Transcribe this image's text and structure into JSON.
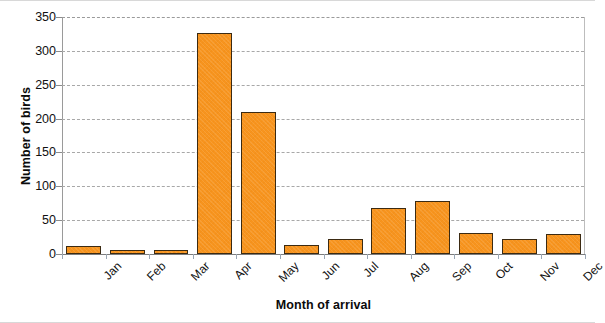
{
  "chart_data": {
    "type": "bar",
    "title": "",
    "subtitle": "",
    "categories": [
      "Jan",
      "Feb",
      "Mar",
      "Apr",
      "May",
      "Jun",
      "Jul",
      "Aug",
      "Sep",
      "Oct",
      "Nov",
      "Dec"
    ],
    "values": [
      12,
      6,
      6,
      327,
      209,
      14,
      22,
      68,
      78,
      31,
      22,
      29
    ],
    "series": [
      {
        "name": "Number of birds",
        "values": [
          12,
          6,
          6,
          327,
          209,
          14,
          22,
          68,
          78,
          31,
          22,
          29
        ]
      }
    ],
    "xlabel": "Month of arrival",
    "ylabel": "Number of birds",
    "ylim": [
      0,
      350
    ],
    "ytick_labels": [
      "0",
      "50",
      "100",
      "150",
      "200",
      "250",
      "300",
      "350"
    ],
    "ytick_values": [
      0,
      50,
      100,
      150,
      200,
      250,
      300,
      350
    ],
    "ytick_step": 50,
    "grid": "horizontal-dashed",
    "legend": "none",
    "bar_color": "#f7941e",
    "bar_border_color": "#3b2a12",
    "gridline_color": "#a8a8a8",
    "axis_color": "#8c8c8c",
    "background_color": "#ffffff"
  }
}
